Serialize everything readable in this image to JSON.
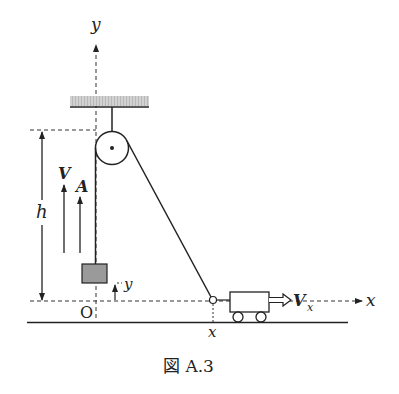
{
  "figure": {
    "caption": "図 A.3",
    "labels": {
      "y_axis": "y",
      "x_axis": "x",
      "height": "h",
      "velocity": "V",
      "acceleration": "A",
      "block_height": "y",
      "origin": "O",
      "cart_position": "x",
      "cart_velocity": "V",
      "cart_velocity_sub": "x"
    },
    "colors": {
      "line": "#222222",
      "ceiling_fill": "#c8c8c8",
      "block_fill": "#9a9a9a"
    }
  }
}
